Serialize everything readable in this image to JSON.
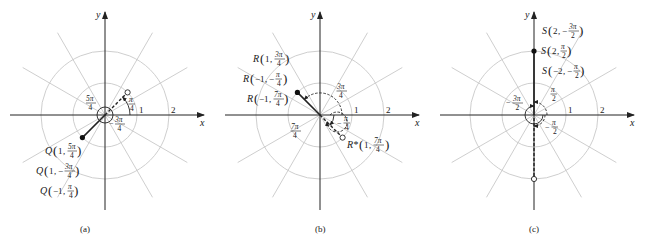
{
  "figure": {
    "panels": [
      {
        "id": "a",
        "caption": "(a)",
        "axis_x_label": "x",
        "axis_y_label": "y",
        "tick_1": "1",
        "tick_2": "2",
        "angle_labels": {
          "a1_num": "π",
          "a1_den": "4",
          "a2_num": "5π",
          "a2_den": "4",
          "a3_sign": "−",
          "a3_num": "3π",
          "a3_den": "4"
        },
        "points": [
          {
            "name": "Q",
            "r": "1",
            "theta_sign": "",
            "theta_num": "5π",
            "theta_den": "4",
            "text": "Q(1, 5π/4)"
          },
          {
            "name": "Q",
            "r": "1",
            "theta_sign": "−",
            "theta_num": "3π",
            "theta_den": "4",
            "text": "Q(1, −3π/4)"
          },
          {
            "name": "Q",
            "r": "−1",
            "theta_sign": "",
            "theta_num": "π",
            "theta_den": "4",
            "text": "Q(−1, π/4)"
          }
        ]
      },
      {
        "id": "b",
        "caption": "(b)",
        "axis_x_label": "x",
        "axis_y_label": "y",
        "tick_1": "1",
        "tick_2": "2",
        "angle_labels": {
          "b1_num": "3π",
          "b1_den": "4",
          "b2_sign": "−",
          "b2_num": "π",
          "b2_den": "4",
          "b3_num": "7π",
          "b3_den": "4"
        },
        "points": [
          {
            "name": "R",
            "r": "1",
            "theta_sign": "",
            "theta_num": "3π",
            "theta_den": "4",
            "text": "R(1, 3π/4)"
          },
          {
            "name": "R",
            "r": "−1",
            "theta_sign": "−",
            "theta_num": "π",
            "theta_den": "4",
            "text": "R(−1, −π/4)"
          },
          {
            "name": "R",
            "r": "−1",
            "theta_sign": "",
            "theta_num": "7π",
            "theta_den": "4",
            "text": "R(−1, 7π/4)"
          },
          {
            "name": "R*",
            "r": "1",
            "theta_sign": "",
            "theta_num": "7π",
            "theta_den": "4",
            "text": "R*(1, 7π/4)"
          }
        ]
      },
      {
        "id": "c",
        "caption": "(c)",
        "axis_x_label": "x",
        "axis_y_label": "y",
        "tick_1": "1",
        "tick_2": "2",
        "angle_labels": {
          "c1_num": "π",
          "c1_den": "2",
          "c2_sign": "−",
          "c2_num": "3π",
          "c2_den": "2",
          "c3_sign": "−",
          "c3_num": "π",
          "c3_den": "2"
        },
        "points": [
          {
            "name": "S",
            "r": "2",
            "theta_sign": "−",
            "theta_num": "3π",
            "theta_den": "2",
            "text": "S(2, −3π/2)"
          },
          {
            "name": "S",
            "r": "2",
            "theta_sign": "",
            "theta_num": "π",
            "theta_den": "2",
            "text": "S(2, π/2)"
          },
          {
            "name": "S",
            "r": "−2",
            "theta_sign": "−",
            "theta_num": "π",
            "theta_den": "2",
            "text": "S(−2, −π/2)"
          }
        ]
      }
    ],
    "labels": {
      "Q": "Q",
      "R": "R",
      "Rstar": "R*",
      "S": "S",
      "one": "1",
      "neg_one": "−1",
      "two": "2",
      "neg_two": "−2",
      "comma": ",",
      "lparen": "(",
      "rparen": ")"
    }
  }
}
